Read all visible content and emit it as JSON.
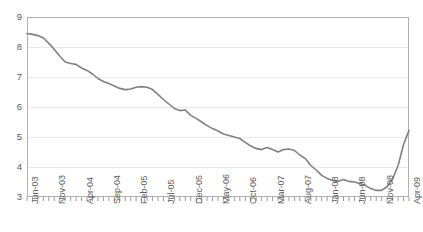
{
  "chart_data": {
    "type": "line",
    "title": "",
    "subtitle": "",
    "xlabel": "",
    "ylabel": "",
    "ylim": [
      3,
      9
    ],
    "yticks": [
      3,
      4,
      5,
      6,
      7,
      8,
      9
    ],
    "ytick_labels": [
      "3",
      "4",
      "5",
      "6",
      "7",
      "8",
      "9"
    ],
    "grid": true,
    "grid_axis": "y",
    "legend": "none",
    "line_color": "#808080",
    "line_width": 1.6,
    "gridline_color": "#e9e9e9",
    "frame_color": "#b0b0b0",
    "text_color": "#5a5a5a",
    "xtick_labels": [
      "Jun-03",
      "Nov-03",
      "Apr-04",
      "Sep-04",
      "Feb-05",
      "Jul-05",
      "Dec-05",
      "May-06",
      "Oct-06",
      "Mar-07",
      "Aug-07",
      "Jan-08",
      "Jun-08",
      "Nov-08",
      "Apr-09"
    ],
    "xtick_interval_months": 5,
    "minor_ticks": "monthly",
    "x": [
      "Jun-03",
      "Jul-03",
      "Aug-03",
      "Sep-03",
      "Oct-03",
      "Nov-03",
      "Dec-03",
      "Jan-04",
      "Feb-04",
      "Mar-04",
      "Apr-04",
      "May-04",
      "Jun-04",
      "Jul-04",
      "Aug-04",
      "Sep-04",
      "Oct-04",
      "Nov-04",
      "Dec-04",
      "Jan-05",
      "Feb-05",
      "Mar-05",
      "Apr-05",
      "May-05",
      "Jun-05",
      "Jul-05",
      "Aug-05",
      "Sep-05",
      "Oct-05",
      "Nov-05",
      "Dec-05",
      "Jan-06",
      "Feb-06",
      "Mar-06",
      "Apr-06",
      "May-06",
      "Jun-06",
      "Jul-06",
      "Aug-06",
      "Sep-06",
      "Oct-06",
      "Nov-06",
      "Dec-06",
      "Jan-07",
      "Feb-07",
      "Mar-07",
      "Apr-07",
      "May-07",
      "Jun-07",
      "Jul-07",
      "Aug-07",
      "Sep-07",
      "Oct-07",
      "Nov-07",
      "Dec-07",
      "Jan-08",
      "Feb-08",
      "Mar-08",
      "Apr-08",
      "May-08",
      "Jun-08",
      "Jul-08",
      "Aug-08",
      "Sep-08",
      "Oct-08",
      "Nov-08",
      "Dec-08",
      "Jan-09",
      "Feb-09",
      "Mar-09",
      "Apr-09"
    ],
    "values": [
      8.45,
      8.42,
      8.38,
      8.3,
      8.12,
      7.92,
      7.7,
      7.5,
      7.45,
      7.42,
      7.3,
      7.22,
      7.1,
      6.95,
      6.85,
      6.78,
      6.7,
      6.62,
      6.58,
      6.6,
      6.66,
      6.68,
      6.66,
      6.58,
      6.42,
      6.25,
      6.1,
      5.95,
      5.88,
      5.9,
      5.72,
      5.62,
      5.5,
      5.38,
      5.28,
      5.2,
      5.1,
      5.05,
      5.0,
      4.95,
      4.82,
      4.7,
      4.62,
      4.58,
      4.65,
      4.58,
      4.5,
      4.58,
      4.6,
      4.55,
      4.4,
      4.28,
      4.05,
      3.9,
      3.72,
      3.62,
      3.55,
      3.52,
      3.58,
      3.52,
      3.5,
      3.45,
      3.38,
      3.28,
      3.22,
      3.22,
      3.35,
      3.6,
      4.05,
      4.75,
      5.22
    ]
  }
}
